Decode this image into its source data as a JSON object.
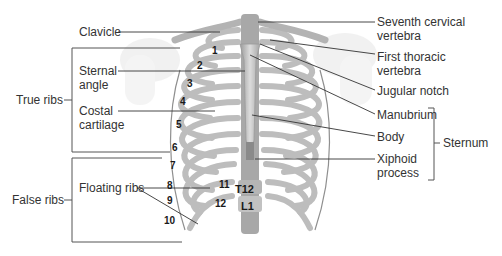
{
  "figure": {
    "colors": {
      "bone": "#c9c9c9",
      "bone_dark": "#8e8e8e",
      "bone_light": "#e6e6e6",
      "leader": "#333333",
      "text": "#333333"
    }
  },
  "labels_left": {
    "clavicle": "Clavicle",
    "sternal_angle_1": "Sternal",
    "sternal_angle_2": "angle",
    "costal_cartilage_1": "Costal",
    "costal_cartilage_2": "cartilage",
    "floating_ribs": "Floating ribs"
  },
  "labels_right": {
    "seventh_cervical_1": "Seventh cervical",
    "seventh_cervical_2": "vertebra",
    "first_thoracic_1": "First thoracic",
    "first_thoracic_2": "vertebra",
    "jugular_notch": "Jugular notch",
    "manubrium": "Manubrium",
    "body": "Body",
    "xiphoid_1": "Xiphoid",
    "xiphoid_2": "process"
  },
  "group_labels": {
    "true_ribs": "True ribs",
    "false_ribs": "False ribs",
    "sternum": "Sternum"
  },
  "rib_numbers": [
    "1",
    "2",
    "3",
    "4",
    "5",
    "6",
    "7",
    "8",
    "9",
    "10",
    "11",
    "12"
  ],
  "vertebra_labels": {
    "t12": "T12",
    "l1": "L1"
  }
}
